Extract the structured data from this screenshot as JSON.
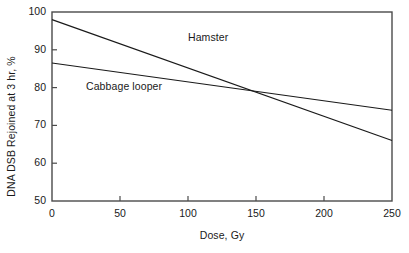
{
  "chart_data": {
    "type": "line",
    "title": "",
    "subtitle": "",
    "xlabel": "Dose, Gy",
    "ylabel": "DNA DSB Rejoined at 3 hr, %",
    "xlim": [
      0,
      250
    ],
    "ylim": [
      50,
      100
    ],
    "xticks": [
      0,
      50,
      100,
      150,
      200,
      250
    ],
    "yticks": [
      50,
      60,
      70,
      80,
      90,
      100
    ],
    "xtick_labels": [
      "0",
      "50",
      "100",
      "150",
      "200",
      "250"
    ],
    "ytick_labels": [
      "50",
      "60",
      "70",
      "80",
      "90",
      "100"
    ],
    "grid": false,
    "legend_position": "inline-annotation",
    "frame": "full-box",
    "tick_direction": "in",
    "line_color": "#1a1a1a",
    "series": [
      {
        "name": "Hamster",
        "x": [
          0,
          250
        ],
        "values": [
          98,
          66
        ],
        "label_x": 100,
        "label_y": 93.5
      },
      {
        "name": "Cabbage looper",
        "x": [
          0,
          250
        ],
        "values": [
          86.5,
          74
        ],
        "label_x": 25,
        "label_y": 80.5
      }
    ],
    "annotations": [
      {
        "text": "crossing point",
        "x": 149,
        "y": 78.5,
        "visible": false
      }
    ]
  },
  "figure": {
    "background_color": "#ffffff",
    "axis_color": "#4a4a4a"
  }
}
